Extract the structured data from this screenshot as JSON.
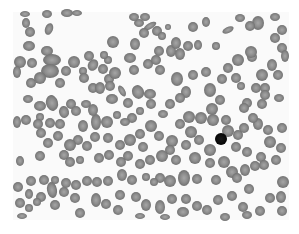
{
  "image": {
    "subject": "blood smear micrograph",
    "mode": "grayscale",
    "background_color": "#ffffff",
    "field_color": "#fafafa",
    "field_bounds": {
      "x": 13,
      "y": 12,
      "w": 276,
      "h": 208
    },
    "cell_fill": "#8c8c8c",
    "cell_edge": "#6e6e6e",
    "cell_center": "#a8a8a8",
    "dark_cell_fill": "#0a0a0a"
  },
  "cells": [
    [
      25,
      14,
      5,
      3,
      0
    ],
    [
      47,
      14,
      5,
      4,
      0
    ],
    [
      67,
      13,
      6,
      4,
      0
    ],
    [
      77,
      13,
      5,
      3,
      0
    ],
    [
      26,
      23,
      4,
      5,
      0
    ],
    [
      30,
      32,
      5,
      5,
      0
    ],
    [
      49,
      29,
      4,
      6,
      20
    ],
    [
      29,
      46,
      6,
      5,
      0
    ],
    [
      47,
      51,
      6,
      5,
      0
    ],
    [
      52,
      60,
      9,
      6,
      0
    ],
    [
      20,
      62,
      6,
      6,
      0
    ],
    [
      32,
      63,
      5,
      5,
      0
    ],
    [
      17,
      72,
      4,
      6,
      0
    ],
    [
      50,
      71,
      9,
      7,
      0
    ],
    [
      74,
      62,
      6,
      6,
      0
    ],
    [
      66,
      71,
      5,
      5,
      0
    ],
    [
      89,
      56,
      5,
      5,
      0
    ],
    [
      93,
      65,
      5,
      6,
      30
    ],
    [
      83,
      71,
      4,
      4,
      0
    ],
    [
      103,
      69,
      5,
      5,
      0
    ],
    [
      31,
      83,
      5,
      5,
      0
    ],
    [
      40,
      78,
      6,
      6,
      0
    ],
    [
      60,
      83,
      5,
      5,
      0
    ],
    [
      84,
      78,
      5,
      5,
      0
    ],
    [
      93,
      88,
      5,
      5,
      0
    ],
    [
      109,
      79,
      5,
      5,
      0
    ],
    [
      100,
      88,
      5,
      6,
      0
    ],
    [
      28,
      99,
      5,
      4,
      0
    ],
    [
      40,
      106,
      6,
      5,
      0
    ],
    [
      52,
      103,
      6,
      8,
      -15
    ],
    [
      71,
      104,
      5,
      5,
      0
    ],
    [
      86,
      104,
      5,
      4,
      0
    ],
    [
      40,
      117,
      4,
      4,
      0
    ],
    [
      17,
      122,
      4,
      6,
      0
    ],
    [
      26,
      120,
      5,
      5,
      0
    ],
    [
      38,
      124,
      5,
      5,
      0
    ],
    [
      50,
      123,
      5,
      5,
      0
    ],
    [
      60,
      124,
      5,
      5,
      0
    ],
    [
      83,
      126,
      5,
      6,
      0
    ],
    [
      96,
      122,
      5,
      8,
      0
    ],
    [
      110,
      86,
      5,
      5,
      0
    ],
    [
      112,
      99,
      6,
      5,
      0
    ],
    [
      115,
      73,
      6,
      6,
      0
    ],
    [
      108,
      60,
      4,
      4,
      0
    ],
    [
      104,
      55,
      4,
      4,
      0
    ],
    [
      139,
      23,
      5,
      4,
      0
    ],
    [
      134,
      17,
      5,
      4,
      0
    ],
    [
      145,
      17,
      5,
      4,
      0
    ],
    [
      150,
      26,
      7,
      3,
      -30
    ],
    [
      144,
      33,
      5,
      5,
      0
    ],
    [
      157,
      31,
      5,
      5,
      0
    ],
    [
      113,
      42,
      6,
      6,
      0
    ],
    [
      135,
      44,
      5,
      6,
      0
    ],
    [
      130,
      58,
      6,
      5,
      0
    ],
    [
      134,
      70,
      5,
      5,
      0
    ],
    [
      148,
      64,
      5,
      5,
      0
    ],
    [
      159,
      51,
      5,
      5,
      0
    ],
    [
      156,
      60,
      5,
      5,
      0
    ],
    [
      160,
      70,
      5,
      5,
      0
    ],
    [
      171,
      51,
      5,
      6,
      0
    ],
    [
      176,
      43,
      5,
      6,
      0
    ],
    [
      180,
      54,
      5,
      6,
      0
    ],
    [
      188,
      46,
      5,
      5,
      0
    ],
    [
      198,
      45,
      4,
      5,
      0
    ],
    [
      162,
      36,
      4,
      4,
      0
    ],
    [
      168,
      27,
      3,
      3,
      0
    ],
    [
      193,
      27,
      5,
      5,
      0
    ],
    [
      206,
      22,
      4,
      5,
      0
    ],
    [
      228,
      30,
      6,
      3,
      -25
    ],
    [
      216,
      46,
      4,
      4,
      0
    ],
    [
      240,
      18,
      5,
      4,
      0
    ],
    [
      258,
      23,
      6,
      7,
      0
    ],
    [
      275,
      17,
      5,
      4,
      0
    ],
    [
      250,
      26,
      5,
      5,
      0
    ],
    [
      282,
      30,
      5,
      5,
      0
    ],
    [
      275,
      38,
      5,
      5,
      0
    ],
    [
      282,
      48,
      5,
      5,
      0
    ],
    [
      285,
      56,
      4,
      6,
      0
    ],
    [
      272,
      65,
      5,
      6,
      0
    ],
    [
      262,
      75,
      6,
      6,
      0
    ],
    [
      252,
      57,
      5,
      5,
      0
    ],
    [
      251,
      52,
      6,
      6,
      0
    ],
    [
      238,
      60,
      6,
      6,
      0
    ],
    [
      228,
      68,
      5,
      5,
      0
    ],
    [
      236,
      78,
      5,
      5,
      0
    ],
    [
      222,
      79,
      5,
      5,
      0
    ],
    [
      256,
      88,
      5,
      5,
      0
    ],
    [
      265,
      88,
      5,
      5,
      0
    ],
    [
      278,
      75,
      5,
      5,
      0
    ],
    [
      279,
      98,
      5,
      4,
      0
    ],
    [
      265,
      95,
      5,
      5,
      0
    ],
    [
      262,
      104,
      5,
      5,
      0
    ],
    [
      247,
      103,
      5,
      5,
      0
    ],
    [
      241,
      86,
      4,
      4,
      0
    ],
    [
      210,
      90,
      6,
      7,
      0
    ],
    [
      220,
      100,
      5,
      5,
      0
    ],
    [
      212,
      109,
      6,
      6,
      0
    ],
    [
      186,
      92,
      5,
      6,
      0
    ],
    [
      206,
      72,
      5,
      5,
      0
    ],
    [
      193,
      75,
      5,
      5,
      0
    ],
    [
      177,
      79,
      6,
      7,
      0
    ],
    [
      180,
      98,
      5,
      5,
      0
    ],
    [
      170,
      104,
      5,
      5,
      0
    ],
    [
      151,
      104,
      5,
      5,
      0
    ],
    [
      163,
      114,
      5,
      4,
      0
    ],
    [
      150,
      94,
      6,
      5,
      0
    ],
    [
      138,
      92,
      6,
      7,
      -20
    ],
    [
      128,
      103,
      5,
      5,
      0
    ],
    [
      122,
      91,
      3,
      6,
      -30
    ],
    [
      140,
      111,
      4,
      4,
      0
    ],
    [
      132,
      118,
      5,
      5,
      0
    ],
    [
      117,
      115,
      4,
      4,
      0
    ],
    [
      125,
      122,
      5,
      4,
      0
    ],
    [
      107,
      122,
      6,
      6,
      0
    ],
    [
      93,
      110,
      5,
      6,
      0
    ],
    [
      64,
      112,
      5,
      6,
      -10
    ],
    [
      76,
      111,
      5,
      5,
      0
    ],
    [
      201,
      118,
      6,
      6,
      0
    ],
    [
      213,
      120,
      6,
      6,
      0
    ],
    [
      189,
      117,
      6,
      6,
      0
    ],
    [
      180,
      124,
      5,
      5,
      0
    ],
    [
      191,
      132,
      6,
      6,
      0
    ],
    [
      199,
      140,
      5,
      5,
      0
    ],
    [
      210,
      150,
      6,
      6,
      0
    ],
    [
      226,
      120,
      5,
      5,
      0
    ],
    [
      228,
      131,
      6,
      6,
      0
    ],
    [
      238,
      135,
      5,
      5,
      0
    ],
    [
      244,
      128,
      5,
      5,
      0
    ],
    [
      236,
      147,
      5,
      5,
      0
    ],
    [
      247,
      152,
      5,
      5,
      0
    ],
    [
      258,
      124,
      5,
      6,
      0
    ],
    [
      268,
      130,
      5,
      5,
      0
    ],
    [
      282,
      128,
      5,
      5,
      0
    ],
    [
      270,
      142,
      6,
      6,
      0
    ],
    [
      281,
      148,
      5,
      5,
      0
    ],
    [
      261,
      157,
      5,
      5,
      0
    ],
    [
      244,
      108,
      5,
      5,
      0
    ],
    [
      253,
      118,
      5,
      5,
      0
    ],
    [
      151,
      126,
      6,
      6,
      0
    ],
    [
      159,
      136,
      5,
      5,
      0
    ],
    [
      140,
      134,
      5,
      5,
      0
    ],
    [
      130,
      140,
      6,
      6,
      0
    ],
    [
      143,
      147,
      5,
      5,
      0
    ],
    [
      120,
      145,
      5,
      5,
      0
    ],
    [
      172,
      141,
      6,
      6,
      0
    ],
    [
      186,
      145,
      5,
      5,
      0
    ],
    [
      170,
      150,
      5,
      5,
      0
    ],
    [
      162,
      156,
      6,
      6,
      0
    ],
    [
      108,
      138,
      5,
      5,
      0
    ],
    [
      95,
      137,
      5,
      5,
      0
    ],
    [
      87,
      146,
      5,
      5,
      0
    ],
    [
      78,
      140,
      5,
      5,
      0
    ],
    [
      70,
      145,
      6,
      6,
      0
    ],
    [
      58,
      136,
      5,
      5,
      0
    ],
    [
      48,
      143,
      5,
      5,
      0
    ],
    [
      40,
      156,
      5,
      5,
      0
    ],
    [
      20,
      161,
      4,
      5,
      0
    ],
    [
      41,
      133,
      5,
      5,
      0
    ],
    [
      64,
      155,
      5,
      5,
      0
    ],
    [
      70,
      162,
      5,
      5,
      0
    ],
    [
      80,
      160,
      4,
      4,
      0
    ],
    [
      99,
      158,
      5,
      5,
      0
    ],
    [
      109,
      155,
      5,
      5,
      0
    ],
    [
      121,
      162,
      5,
      5,
      0
    ],
    [
      128,
      156,
      5,
      5,
      0
    ],
    [
      140,
      164,
      5,
      5,
      0
    ],
    [
      150,
      160,
      5,
      5,
      0
    ],
    [
      176,
      160,
      5,
      5,
      0
    ],
    [
      195,
      158,
      6,
      6,
      0
    ],
    [
      210,
      163,
      5,
      5,
      0
    ],
    [
      224,
      162,
      6,
      6,
      0
    ],
    [
      232,
      172,
      6,
      6,
      0
    ],
    [
      245,
      170,
      5,
      6,
      0
    ],
    [
      255,
      166,
      5,
      5,
      0
    ],
    [
      264,
      165,
      5,
      5,
      0
    ],
    [
      276,
      160,
      5,
      5,
      0
    ],
    [
      283,
      182,
      6,
      6,
      0
    ],
    [
      249,
      189,
      5,
      5,
      0
    ],
    [
      237,
      178,
      5,
      5,
      0
    ],
    [
      216,
      180,
      5,
      5,
      0
    ],
    [
      197,
      179,
      5,
      5,
      0
    ],
    [
      184,
      178,
      6,
      8,
      0
    ],
    [
      170,
      181,
      6,
      6,
      0
    ],
    [
      160,
      178,
      5,
      5,
      0
    ],
    [
      154,
      182,
      4,
      4,
      0
    ],
    [
      146,
      177,
      4,
      4,
      0
    ],
    [
      132,
      180,
      5,
      5,
      0
    ],
    [
      122,
      175,
      5,
      6,
      0
    ],
    [
      108,
      181,
      5,
      5,
      0
    ],
    [
      97,
      182,
      5,
      5,
      0
    ],
    [
      87,
      181,
      5,
      5,
      0
    ],
    [
      76,
      185,
      5,
      5,
      0
    ],
    [
      66,
      183,
      5,
      5,
      0
    ],
    [
      55,
      180,
      4,
      4,
      0
    ],
    [
      44,
      180,
      5,
      5,
      0
    ],
    [
      31,
      181,
      5,
      5,
      0
    ],
    [
      18,
      187,
      5,
      5,
      0
    ],
    [
      52,
      190,
      5,
      8,
      -10
    ],
    [
      64,
      192,
      5,
      5,
      0
    ],
    [
      75,
      198,
      5,
      5,
      0
    ],
    [
      41,
      197,
      5,
      5,
      0
    ],
    [
      29,
      194,
      4,
      5,
      0
    ],
    [
      20,
      203,
      5,
      5,
      0
    ],
    [
      29,
      208,
      4,
      4,
      0
    ],
    [
      37,
      202,
      4,
      4,
      0
    ],
    [
      55,
      205,
      5,
      5,
      0
    ],
    [
      80,
      213,
      5,
      5,
      0
    ],
    [
      120,
      195,
      5,
      5,
      0
    ],
    [
      136,
      197,
      5,
      5,
      0
    ],
    [
      146,
      205,
      5,
      6,
      0
    ],
    [
      160,
      207,
      5,
      7,
      0
    ],
    [
      172,
      199,
      5,
      5,
      0
    ],
    [
      186,
      199,
      5,
      5,
      0
    ],
    [
      183,
      212,
      6,
      5,
      0
    ],
    [
      197,
      206,
      5,
      5,
      0
    ],
    [
      207,
      210,
      5,
      5,
      0
    ],
    [
      218,
      200,
      5,
      5,
      0
    ],
    [
      232,
      196,
      5,
      5,
      0
    ],
    [
      243,
      207,
      5,
      5,
      0
    ],
    [
      247,
      215,
      5,
      4,
      0
    ],
    [
      260,
      211,
      5,
      5,
      0
    ],
    [
      270,
      198,
      5,
      5,
      0
    ],
    [
      281,
      197,
      5,
      6,
      0
    ],
    [
      282,
      211,
      5,
      5,
      0
    ],
    [
      96,
      200,
      5,
      7,
      0
    ],
    [
      106,
      204,
      5,
      5,
      0
    ],
    [
      118,
      210,
      5,
      5,
      0
    ],
    [
      225,
      217,
      5,
      4,
      0
    ],
    [
      165,
      217,
      5,
      3,
      0
    ],
    [
      140,
      216,
      5,
      3,
      0
    ],
    [
      22,
      216,
      5,
      3,
      0
    ]
  ],
  "dark_cells": [
    [
      221,
      139,
      6,
      6,
      0
    ]
  ]
}
